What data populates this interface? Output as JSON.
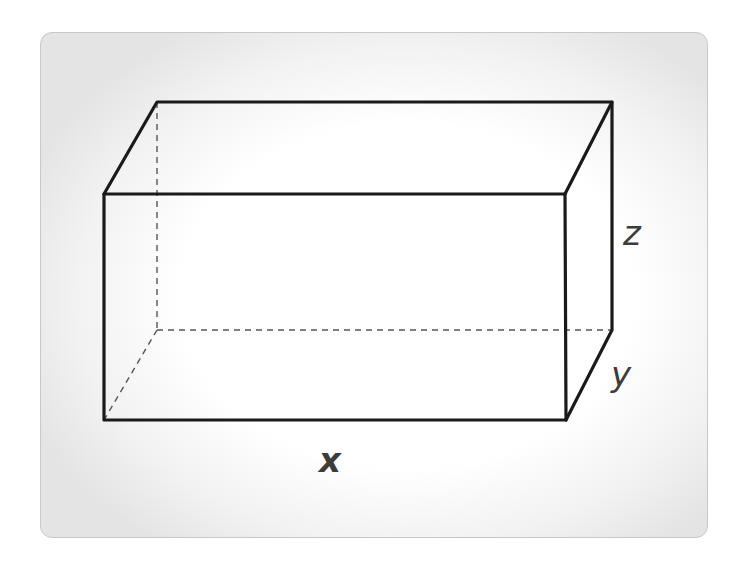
{
  "diagram": {
    "type": "rectangular-prism",
    "labels": {
      "length": "x",
      "depth": "y",
      "height": "z"
    },
    "colors": {
      "edge": "#1a1a1a",
      "hidden_edge": "#555555",
      "label": "#3c3c3c",
      "card_border": "#c8c8c8",
      "card_edge_shade": "#e4e4e4"
    },
    "vertices": {
      "front_top_left": [
        104,
        194
      ],
      "front_top_right": [
        565,
        194
      ],
      "front_bottom_left": [
        104,
        420
      ],
      "front_bottom_right": [
        566,
        420
      ],
      "back_top_left": [
        157,
        102
      ],
      "back_top_right": [
        612,
        102
      ],
      "back_bottom_right": [
        612,
        330
      ],
      "back_bottom_left": [
        157,
        330
      ]
    }
  }
}
